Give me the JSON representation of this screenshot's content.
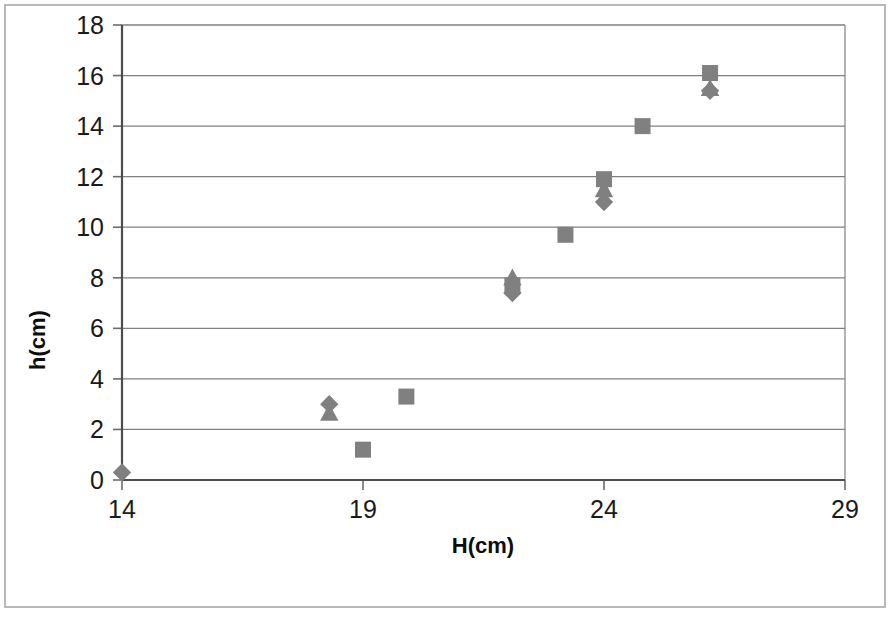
{
  "chart_data": {
    "type": "scatter",
    "title": "",
    "xlabel": "H(cm)",
    "ylabel": "h(cm)",
    "xlim": [
      14,
      29
    ],
    "ylim": [
      0,
      18
    ],
    "xticks": [
      14,
      19,
      24,
      29
    ],
    "yticks": [
      0,
      2,
      4,
      6,
      8,
      10,
      12,
      14,
      16,
      18
    ],
    "grid": "horizontal",
    "legend": "none",
    "marker_color": "#808080",
    "series": [
      {
        "name": "series-1-diamond",
        "marker": "diamond",
        "points": [
          {
            "x": 14.0,
            "y": 0.3
          },
          {
            "x": 18.3,
            "y": 3.0
          },
          {
            "x": 22.1,
            "y": 7.4
          },
          {
            "x": 24.0,
            "y": 11.0
          },
          {
            "x": 26.2,
            "y": 15.4
          }
        ]
      },
      {
        "name": "series-2-square",
        "marker": "square",
        "points": [
          {
            "x": 19.0,
            "y": 1.2
          },
          {
            "x": 19.9,
            "y": 3.3
          },
          {
            "x": 22.1,
            "y": 7.7
          },
          {
            "x": 23.2,
            "y": 9.7
          },
          {
            "x": 24.0,
            "y": 11.9
          },
          {
            "x": 24.8,
            "y": 14.0
          },
          {
            "x": 26.2,
            "y": 16.1
          }
        ]
      },
      {
        "name": "series-3-triangle",
        "marker": "triangle",
        "points": [
          {
            "x": 18.3,
            "y": 2.65
          },
          {
            "x": 22.1,
            "y": 8.0
          },
          {
            "x": 24.0,
            "y": 11.5
          },
          {
            "x": 26.2,
            "y": 15.5
          }
        ]
      }
    ]
  }
}
